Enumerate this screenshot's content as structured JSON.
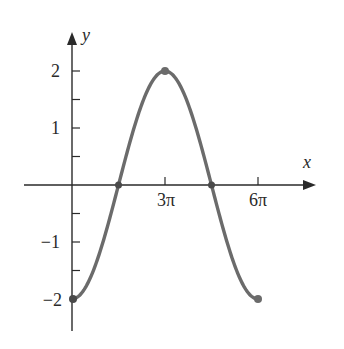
{
  "chart_data": {
    "type": "line",
    "title": "",
    "function": "y = -2cos(x/3)",
    "xlabel": "x",
    "ylabel": "y",
    "x_ticks": [
      {
        "value": 9.42477796,
        "label": "3π"
      },
      {
        "value": 18.84955592,
        "label": "6π"
      }
    ],
    "y_ticks": [
      {
        "value": 2,
        "label": "2"
      },
      {
        "value": 1.5,
        "label": ""
      },
      {
        "value": 1,
        "label": "1"
      },
      {
        "value": 0.5,
        "label": ""
      },
      {
        "value": -0.5,
        "label": ""
      },
      {
        "value": -1,
        "label": "−1"
      },
      {
        "value": -1.5,
        "label": ""
      },
      {
        "value": -2,
        "label": "−2"
      }
    ],
    "xlim": [
      -2.5,
      3.2
    ],
    "ylim": [
      -2.5,
      2.7
    ],
    "grid": false,
    "series": [
      {
        "name": "curve",
        "color": "#6b6b6b",
        "x_in_pi": [
          0,
          0.75,
          1.5,
          2.25,
          3,
          3.75,
          4.5,
          5.25,
          6
        ],
        "y": [
          -2,
          -1.414,
          0,
          1.414,
          2,
          1.414,
          0,
          -1.414,
          -2
        ]
      }
    ],
    "marked_points": [
      {
        "x_in_pi": 0,
        "y": -2
      },
      {
        "x_in_pi": 1.5,
        "y": 0
      },
      {
        "x_in_pi": 3,
        "y": 2
      },
      {
        "x_in_pi": 4.5,
        "y": 0
      },
      {
        "x_in_pi": 6,
        "y": -2
      }
    ]
  },
  "labels": {
    "x_axis": "x",
    "y_axis": "y",
    "tick_3pi": "3π",
    "tick_6pi": "6π",
    "tick_2": "2",
    "tick_1": "1",
    "tick_m1": "−1",
    "tick_m2": "−2"
  },
  "colors": {
    "axis": "#2a2a2a",
    "curve": "#6b6b6b",
    "point": "#4a4a4a"
  }
}
